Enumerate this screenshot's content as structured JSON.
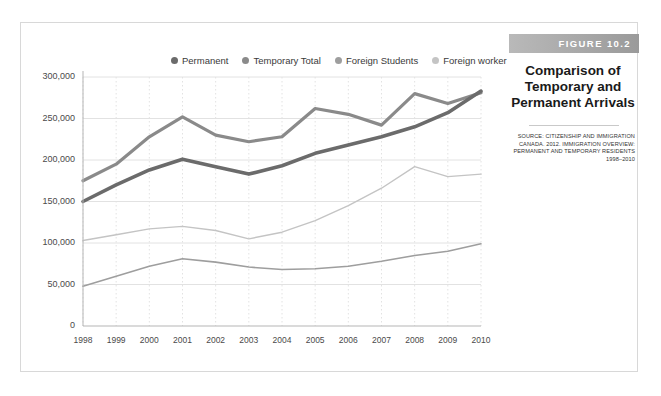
{
  "figure": {
    "band_label": "FIGURE 10.2",
    "title_line_1": "Comparison of",
    "title_line_2": "Temporary and",
    "title_line_3": "Permanent Arrivals",
    "source_line_1": "SOURCE: CITIZENSHIP AND IMMIGRATION",
    "source_line_2": "CANADA. 2012. IMMIGRATION OVERVIEW:",
    "source_line_3": "PERMANENT AND TEMPORARY RESIDENTS",
    "source_line_4": "1998–2010"
  },
  "colors": {
    "permanent": "#6b6b6b",
    "temporary_total": "#8a8a8a",
    "foreign_students": "#9e9e9e",
    "foreign_worker": "#c4c4c4",
    "grid": "#e2e2e2",
    "axis": "#b5b5b5",
    "band_start": "#b9b9b9",
    "band_end": "#9a9a9a"
  },
  "chart_data": {
    "type": "line",
    "title": "Comparison of Temporary and Permanent Arrivals",
    "xlabel": "",
    "ylabel": "",
    "grid": true,
    "legend_position": "top",
    "ylim": [
      0,
      300000
    ],
    "yticks": [
      "0",
      "50,000",
      "100,000",
      "150,000",
      "200,000",
      "250,000",
      "300,000"
    ],
    "ytick_values": [
      0,
      50000,
      100000,
      150000,
      200000,
      250000,
      300000
    ],
    "categories": [
      "1998",
      "1999",
      "2000",
      "2001",
      "2002",
      "2003",
      "2004",
      "2005",
      "2006",
      "2007",
      "2008",
      "2009",
      "2010"
    ],
    "series": [
      {
        "name": "Permanent",
        "color": "#6b6b6b",
        "width": 3.6,
        "values": [
          150000,
          170000,
          188000,
          201000,
          192000,
          183000,
          193000,
          208000,
          218000,
          228000,
          240000,
          257000,
          283000
        ]
      },
      {
        "name": "Temporary Total",
        "color": "#8a8a8a",
        "width": 3.2,
        "values": [
          175000,
          195000,
          228000,
          252000,
          230000,
          222000,
          228000,
          262000,
          255000,
          242000,
          280000,
          268000,
          281000
        ]
      },
      {
        "name": "Foreign Students",
        "color": "#9e9e9e",
        "width": 1.6,
        "values": [
          48000,
          60000,
          72000,
          81000,
          77000,
          71000,
          68000,
          69000,
          72000,
          78000,
          85000,
          90000,
          99000
        ]
      },
      {
        "name": "Foreign worker",
        "color": "#c4c4c4",
        "width": 1.4,
        "values": [
          103000,
          110000,
          117000,
          120000,
          115000,
          105000,
          113000,
          127000,
          145000,
          166000,
          192000,
          180000,
          183000
        ]
      }
    ]
  }
}
